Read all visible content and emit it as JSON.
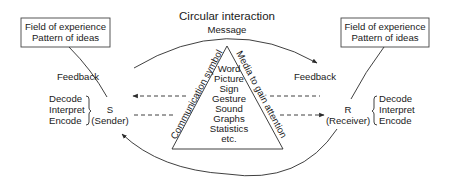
{
  "title": "Circular interaction",
  "message_label": "Message",
  "left_box": {
    "line1": "Field of experience",
    "line2": "Pattern of ideas"
  },
  "right_box": {
    "line1": "Field of experience",
    "line2": "Pattern of ideas"
  },
  "feedback_left": "Feedback",
  "feedback_right": "Feedback",
  "sender": {
    "letter": "S",
    "label": "(Sender)",
    "processes": [
      "Decode",
      "Interpret",
      "Encode"
    ]
  },
  "receiver": {
    "letter": "R",
    "label": "(Receiver)",
    "processes": [
      "Decode",
      "Interpret",
      "Encode"
    ]
  },
  "triangle": {
    "left_side_label": "Communication symbol",
    "right_side_label": "Media to gain attention",
    "items": [
      "Word",
      "Picture",
      "Sign",
      "Gesture",
      "Sound",
      "Graphs",
      "Statistics",
      "etc."
    ]
  },
  "colors": {
    "line": "#2a2a2a",
    "text": "#1a1a1a",
    "background": "#ffffff"
  }
}
